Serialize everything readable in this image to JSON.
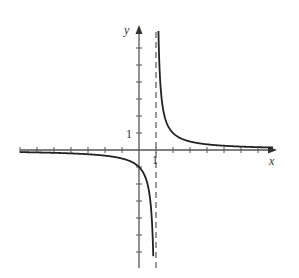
{
  "figure": {
    "x_axis_label": "x",
    "y_axis_label": "y",
    "x_tick_label": "1",
    "y_tick_label": "1"
  },
  "chart_data": {
    "type": "line",
    "title": "",
    "function": "y = 1/(x - 1)",
    "xlabel": "x",
    "ylabel": "y",
    "vertical_asymptote": {
      "x": 1,
      "style": "dashed"
    },
    "horizontal_asymptote": {
      "y": 0
    },
    "xlim": [
      -7,
      8
    ],
    "ylim": [
      -7,
      7
    ],
    "x_ticks": [
      -7,
      -6,
      -5,
      -4,
      -3,
      -2,
      -1,
      1,
      2,
      3,
      4,
      5,
      6,
      7
    ],
    "y_ticks": [
      -6,
      -5,
      -4,
      -3,
      -2,
      -1,
      1,
      2,
      3,
      4,
      5,
      6
    ],
    "labeled_ticks": {
      "x": [
        1
      ],
      "y": [
        1
      ]
    },
    "grid": false,
    "colors": {
      "curve": "#222222",
      "axes": "#555555",
      "asymptote": "#555555"
    }
  }
}
